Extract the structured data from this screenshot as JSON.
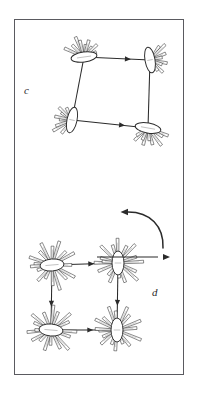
{
  "figure": {
    "background_color": "#ffffff",
    "frame": {
      "name": "figure-border",
      "stroke_color": "#5a5a60",
      "x": 14,
      "y": 19,
      "width": 170,
      "height": 356
    },
    "panels": [
      {
        "id": "c",
        "label": "c",
        "label_x": 24,
        "label_y": 85,
        "description": "square cycle of four elongated ellipsoidal particles with radiating bristles, joined by straight arrows",
        "nodes": [
          {
            "name": "node-top-left",
            "cx": 84,
            "cy": 57,
            "rx": 13,
            "ry": 5,
            "rotation": -8,
            "bristles": 9,
            "bristle_len": 20,
            "spread_start": -150,
            "spread_end": -25
          },
          {
            "name": "node-top-right",
            "cx": 150,
            "cy": 60,
            "rx": 5,
            "ry": 13,
            "rotation": -10,
            "bristles": 8,
            "bristle_len": 20,
            "spread_start": -60,
            "spread_end": 60
          },
          {
            "name": "node-bottom-right",
            "cx": 148,
            "cy": 128,
            "rx": 13,
            "ry": 5,
            "rotation": 10,
            "bristles": 9,
            "bristle_len": 20,
            "spread_start": 20,
            "spread_end": 150
          },
          {
            "name": "node-bottom-left",
            "cx": 72,
            "cy": 120,
            "rx": 5,
            "ry": 13,
            "rotation": 12,
            "bristles": 8,
            "bristle_len": 20,
            "spread_start": 130,
            "spread_end": 245
          }
        ],
        "edges": [
          {
            "name": "edge-top",
            "x1": 84,
            "y1": 57,
            "x2": 150,
            "y2": 60,
            "arrow": "forward",
            "arrow_at": 0.62
          },
          {
            "name": "edge-right",
            "x1": 150,
            "y1": 60,
            "x2": 148,
            "y2": 128,
            "arrow": "none",
            "arrow_at": 0.6
          },
          {
            "name": "edge-bottom",
            "x1": 72,
            "y1": 120,
            "x2": 148,
            "y2": 128,
            "arrow": "forward",
            "arrow_at": 0.62
          },
          {
            "name": "edge-left",
            "x1": 84,
            "y1": 57,
            "x2": 72,
            "y2": 120,
            "arrow": "none",
            "arrow_at": 0.6
          }
        ]
      },
      {
        "id": "d",
        "label": "d",
        "label_x": 152,
        "label_y": 287,
        "description": "square cycle of four dense starburst particles with many radiating bristles, joined by short arrows; a curved rotation arrow and a straight exit arrow at upper right",
        "nodes": [
          {
            "name": "node-top-left",
            "cx": 52,
            "cy": 265,
            "rx": 12,
            "ry": 6,
            "rotation": -5,
            "bristles": 17,
            "bristle_len": 24,
            "spread_start": -180,
            "spread_end": 180
          },
          {
            "name": "node-top-right",
            "cx": 118,
            "cy": 263,
            "rx": 6,
            "ry": 12,
            "rotation": 0,
            "bristles": 17,
            "bristle_len": 24,
            "spread_start": -180,
            "spread_end": 180
          },
          {
            "name": "node-bottom-right",
            "cx": 117,
            "cy": 330,
            "rx": 6,
            "ry": 12,
            "rotation": 0,
            "bristles": 17,
            "bristle_len": 24,
            "spread_start": -180,
            "spread_end": 180
          },
          {
            "name": "node-bottom-left",
            "cx": 51,
            "cy": 330,
            "rx": 12,
            "ry": 6,
            "rotation": 5,
            "bristles": 17,
            "bristle_len": 24,
            "spread_start": -180,
            "spread_end": 180
          }
        ],
        "edges": [
          {
            "name": "edge-top",
            "x1": 52,
            "y1": 265,
            "x2": 118,
            "y2": 263,
            "arrow": "forward",
            "arrow_at": 0.55
          },
          {
            "name": "edge-right",
            "x1": 118,
            "y1": 263,
            "x2": 117,
            "y2": 330,
            "arrow": "forward",
            "arrow_at": 0.55
          },
          {
            "name": "edge-bottom",
            "x1": 51,
            "y1": 330,
            "x2": 117,
            "y2": 330,
            "arrow": "forward",
            "arrow_at": 0.55
          },
          {
            "name": "edge-left",
            "x1": 52,
            "y1": 265,
            "x2": 51,
            "y2": 330,
            "arrow": "forward",
            "arrow_at": 0.55
          }
        ],
        "curved_arrow": {
          "name": "rotation-arrow",
          "path": "M 163 248 C 164 226 150 212 128 212",
          "head_x": 128,
          "head_y": 212,
          "head_angle": 180,
          "direction": "counterclockwise-to-left"
        },
        "straight_arrow": {
          "name": "translation-arrow",
          "x1": 97,
          "y1": 257,
          "x2": 163,
          "y2": 257,
          "direction": "right"
        }
      }
    ]
  }
}
